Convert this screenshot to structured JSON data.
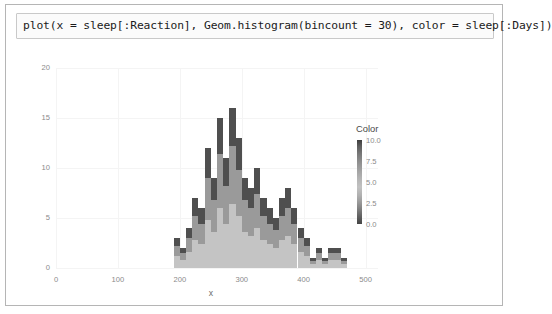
{
  "cell": {
    "code": "plot(x = sleep[:Reaction], Geom.histogram(bincount = 30), color = sleep[:Days])"
  },
  "legend": {
    "title": "Color",
    "ticks": [
      "10.0",
      "7.5",
      "5.0",
      "2.5",
      "0.0"
    ],
    "gradient_top_color": "#3d3d3d",
    "gradient_mid_color": "#c2c2c2",
    "gradient_bottom_color": "#454545"
  },
  "chart_data": {
    "type": "bar",
    "title": "",
    "xlabel": "x",
    "ylabel": "",
    "xlim": [
      0,
      520
    ],
    "ylim": [
      0,
      20
    ],
    "xticks": [
      0,
      100,
      200,
      300,
      400,
      500
    ],
    "yticks": [
      0,
      5,
      10,
      15,
      20
    ],
    "grid": true,
    "legend_position": "right",
    "stacked": true,
    "bin_width": 10,
    "bincount": 30,
    "categories": [
      195,
      205,
      215,
      225,
      235,
      245,
      255,
      265,
      275,
      285,
      295,
      305,
      315,
      325,
      335,
      345,
      355,
      365,
      375,
      385,
      395,
      405,
      415,
      425,
      435,
      445,
      455,
      465
    ],
    "values": [
      3,
      2,
      4,
      7,
      6,
      12,
      9,
      15,
      11,
      16,
      13,
      9,
      8,
      10,
      7,
      6,
      5,
      7,
      8,
      6,
      4,
      3,
      1,
      2,
      1,
      2,
      2,
      1
    ],
    "stacks": [
      [
        1.2,
        1.0,
        0.8
      ],
      [
        0.8,
        0.7,
        0.5
      ],
      [
        1.6,
        1.4,
        1.0
      ],
      [
        2.8,
        2.4,
        1.8
      ],
      [
        2.4,
        2.0,
        1.6
      ],
      [
        4.8,
        4.2,
        3.0
      ],
      [
        3.6,
        3.2,
        2.2
      ],
      [
        6.0,
        5.4,
        3.6
      ],
      [
        4.4,
        3.8,
        2.8
      ],
      [
        6.4,
        5.8,
        3.8
      ],
      [
        5.2,
        4.6,
        3.2
      ],
      [
        3.6,
        3.2,
        2.2
      ],
      [
        3.2,
        2.8,
        2.0
      ],
      [
        4.0,
        3.4,
        2.6
      ],
      [
        2.8,
        2.4,
        1.8
      ],
      [
        2.4,
        2.0,
        1.6
      ],
      [
        2.0,
        1.8,
        1.2
      ],
      [
        2.8,
        2.4,
        1.8
      ],
      [
        3.2,
        2.8,
        2.0
      ],
      [
        2.4,
        2.0,
        1.6
      ],
      [
        1.6,
        1.4,
        1.0
      ],
      [
        1.2,
        1.0,
        0.8
      ],
      [
        0.4,
        0.3,
        0.3
      ],
      [
        0.8,
        0.7,
        0.5
      ],
      [
        0.4,
        0.3,
        0.3
      ],
      [
        0.8,
        0.7,
        0.5
      ],
      [
        0.8,
        0.7,
        0.5
      ],
      [
        0.4,
        0.3,
        0.3
      ]
    ],
    "series": [
      {
        "name": "low",
        "color": "#c4c4c4"
      },
      {
        "name": "mid",
        "color": "#9a9a9a"
      },
      {
        "name": "high",
        "color": "#4f4f4f"
      }
    ]
  }
}
